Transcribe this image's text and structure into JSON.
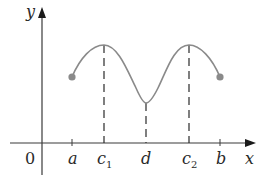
{
  "diagram": {
    "axes": {
      "x_label": "x",
      "y_label": "y",
      "origin_label": "0"
    },
    "ticks": [
      {
        "label": "a",
        "sub": "",
        "x": 72
      },
      {
        "label": "c",
        "sub": "1",
        "x": 104
      },
      {
        "label": "d",
        "sub": "",
        "x": 146
      },
      {
        "label": "c",
        "sub": "2",
        "x": 189
      },
      {
        "label": "b",
        "sub": "",
        "x": 220
      }
    ],
    "curve": {
      "description": "Wave on closed interval [a,b]: local max at c1 and c2, local min at d",
      "start_point": {
        "x": 72,
        "y": 77
      },
      "end_point": {
        "x": 220,
        "y": 77
      },
      "maxima_x": [
        "c1",
        "c2"
      ],
      "minimum_x": "d"
    },
    "colors": {
      "curve": "#8a8a8a",
      "axis": "#3a3a3a",
      "dashes": "#2a2a2a",
      "endpoint_dot": "#8a8a8a"
    }
  }
}
